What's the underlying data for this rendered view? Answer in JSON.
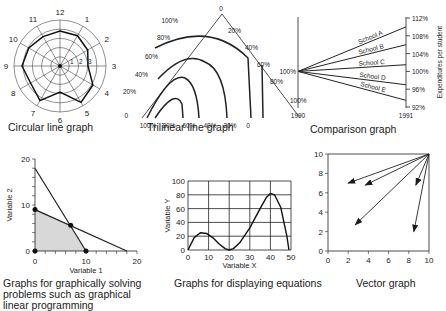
{
  "captions": {
    "circular": "Circular line graph",
    "trilinear": "Trilinear line graph",
    "comparison": "Comparison graph",
    "linear_prog": "Graphs for graphically solving problems such as graphical linear programming",
    "equations": "Graphs for displaying equations",
    "vector": "Vector graph"
  },
  "chart_data": [
    {
      "type": "radar",
      "title": "Circular line graph",
      "categories": [
        "12",
        "1",
        "2",
        "3",
        "4",
        "5",
        "6",
        "7",
        "8",
        "9",
        "10",
        "11"
      ],
      "radial_ticks": [
        "1",
        "2",
        "3"
      ],
      "values": [
        3.5,
        3.5,
        3.2,
        2.8,
        3.8,
        4.2,
        2.6,
        4.0,
        3.4,
        3.8,
        3.6,
        3.4
      ],
      "rings": 5
    },
    {
      "type": "line",
      "title": "Trilinear line graph",
      "left_axis_ticks": [
        "0",
        "20%",
        "40%",
        "60%",
        "80%",
        "100%"
      ],
      "right_axis_ticks": [
        "0",
        "20%",
        "40%",
        "60%",
        "80%",
        "100%"
      ],
      "bottom_axis_ticks": [
        "100%",
        "80%",
        "60%",
        "40%",
        "20%",
        "0"
      ],
      "curves": 4
    },
    {
      "type": "line",
      "title": "Comparison graph",
      "x": [
        "1990",
        "1991"
      ],
      "ylabel": "Expenditures per student",
      "y_ticks": [
        "112%",
        "108%",
        "104%",
        "100%",
        "96%",
        "92%"
      ],
      "start_label": "100%",
      "series": [
        {
          "name": "School A",
          "values": [
            100,
            110
          ]
        },
        {
          "name": "School B",
          "values": [
            100,
            106
          ]
        },
        {
          "name": "School C",
          "values": [
            100,
            101.5
          ]
        },
        {
          "name": "School D",
          "values": [
            100,
            97
          ]
        },
        {
          "name": "School E",
          "values": [
            100,
            93.5
          ]
        }
      ]
    },
    {
      "type": "line",
      "title": "Graphs for graphically solving problems such as graphical linear programming",
      "xlabel": "Variable 1",
      "ylabel": "Variable 2",
      "x_ticks": [
        "0",
        "10",
        "20"
      ],
      "y_ticks": [
        "0",
        "10",
        "20"
      ],
      "series": [
        {
          "name": "Constraint 1",
          "points": [
            [
              0,
              18
            ],
            [
              10,
              0
            ]
          ]
        },
        {
          "name": "Constraint 2",
          "points": [
            [
              0,
              9
            ],
            [
              18,
              0
            ]
          ]
        }
      ],
      "feasible_region": [
        [
          0,
          0
        ],
        [
          0,
          9
        ],
        [
          7,
          5.6
        ],
        [
          10,
          0
        ]
      ],
      "marked_points": [
        [
          0,
          0
        ],
        [
          0,
          9
        ],
        [
          7,
          5.6
        ],
        [
          10,
          0
        ]
      ]
    },
    {
      "type": "line",
      "title": "Graphs for displaying equations",
      "xlabel": "Variable X",
      "ylabel": "Variable Y",
      "x_ticks": [
        "0",
        "10",
        "20",
        "30",
        "40",
        "50"
      ],
      "y_ticks": [
        "0",
        "20",
        "40",
        "60",
        "80",
        "100"
      ],
      "xlim": [
        0,
        50
      ],
      "ylim": [
        0,
        100
      ],
      "grid": true,
      "series": [
        {
          "name": "curve",
          "points": [
            [
              0,
              0
            ],
            [
              3,
              18
            ],
            [
              6,
              25
            ],
            [
              9,
              24
            ],
            [
              12,
              18
            ],
            [
              15,
              9
            ],
            [
              18,
              2
            ],
            [
              20,
              0
            ],
            [
              22,
              2
            ],
            [
              25,
              10
            ],
            [
              30,
              32
            ],
            [
              35,
              60
            ],
            [
              38,
              76
            ],
            [
              40,
              82
            ],
            [
              42,
              80
            ],
            [
              45,
              62
            ],
            [
              48,
              20
            ],
            [
              49,
              0
            ]
          ]
        }
      ]
    },
    {
      "type": "vector",
      "title": "Vector graph",
      "x_ticks": [
        "0",
        "2",
        "4",
        "6",
        "8",
        "10"
      ],
      "y_ticks": [
        "0",
        "2",
        "4",
        "6",
        "8",
        "10"
      ],
      "xlim": [
        0,
        10
      ],
      "ylim": [
        0,
        10
      ],
      "origin": [
        10,
        10
      ],
      "vectors": [
        [
          2,
          7
        ],
        [
          3.7,
          6.8
        ],
        [
          8.7,
          6.8
        ],
        [
          2.7,
          2.7
        ],
        [
          8.5,
          2
        ]
      ]
    }
  ]
}
